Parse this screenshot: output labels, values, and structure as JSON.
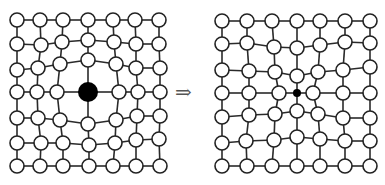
{
  "figure": {
    "arrow_label": "⇒",
    "colors": {
      "atom_fill": "#ffffff",
      "atom_stroke": "#222222",
      "bond": "#2a2a2a",
      "solute": "#000000"
    },
    "atom_radius": 7,
    "left_lattice": {
      "name": "large-solute-lattice",
      "solute": {
        "row": 3,
        "col": 3,
        "x": 88,
        "y": 92,
        "r": 10
      },
      "rows": [
        [
          [
            17,
            20
          ],
          [
            40,
            20
          ],
          [
            63,
            20
          ],
          [
            88,
            20
          ],
          [
            113,
            20
          ],
          [
            135,
            20
          ],
          [
            159,
            20
          ]
        ],
        [
          [
            17,
            44
          ],
          [
            41,
            45
          ],
          [
            62,
            42
          ],
          [
            88,
            40
          ],
          [
            114,
            42
          ],
          [
            136,
            44
          ],
          [
            159,
            44
          ]
        ],
        [
          [
            17,
            70
          ],
          [
            38,
            68
          ],
          [
            60,
            64
          ],
          [
            88,
            60
          ],
          [
            116,
            64
          ],
          [
            136,
            68
          ],
          [
            160,
            68
          ]
        ],
        [
          [
            17,
            92
          ],
          [
            37,
            92
          ],
          [
            57,
            92
          ],
          [
            88,
            92
          ],
          [
            119,
            92
          ],
          [
            138,
            92
          ],
          [
            160,
            92
          ]
        ],
        [
          [
            17,
            118
          ],
          [
            38,
            118
          ],
          [
            60,
            120
          ],
          [
            88,
            124
          ],
          [
            116,
            120
          ],
          [
            137,
            116
          ],
          [
            160,
            116
          ]
        ],
        [
          [
            17,
            143
          ],
          [
            41,
            143
          ],
          [
            63,
            143
          ],
          [
            89,
            145
          ],
          [
            115,
            143
          ],
          [
            136,
            140
          ],
          [
            159,
            139
          ]
        ],
        [
          [
            17,
            166
          ],
          [
            40,
            166
          ],
          [
            63,
            166
          ],
          [
            89,
            166
          ],
          [
            113,
            166
          ],
          [
            136,
            166
          ],
          [
            160,
            166
          ]
        ]
      ]
    },
    "right_lattice": {
      "name": "small-solute-lattice",
      "solute": {
        "row": 3,
        "col": 3,
        "x": 297,
        "y": 93,
        "r": 4
      },
      "rows": [
        [
          [
            222,
            21
          ],
          [
            247,
            21
          ],
          [
            272,
            21
          ],
          [
            297,
            21
          ],
          [
            320,
            21
          ],
          [
            345,
            21
          ],
          [
            370,
            21
          ]
        ],
        [
          [
            222,
            44
          ],
          [
            247,
            43
          ],
          [
            274,
            47
          ],
          [
            297,
            48
          ],
          [
            320,
            45
          ],
          [
            345,
            42
          ],
          [
            370,
            43
          ]
        ],
        [
          [
            222,
            70
          ],
          [
            249,
            71
          ],
          [
            275,
            72
          ],
          [
            297,
            76
          ],
          [
            318,
            72
          ],
          [
            343,
            70
          ],
          [
            370,
            67
          ]
        ],
        [
          [
            222,
            93
          ],
          [
            249,
            93
          ],
          [
            279,
            93
          ],
          [
            297,
            93
          ],
          [
            313,
            93
          ],
          [
            343,
            93
          ],
          [
            370,
            93
          ]
        ],
        [
          [
            222,
            117
          ],
          [
            249,
            115
          ],
          [
            275,
            114
          ],
          [
            297,
            111
          ],
          [
            318,
            114
          ],
          [
            343,
            118
          ],
          [
            370,
            118
          ]
        ],
        [
          [
            222,
            143
          ],
          [
            246,
            141
          ],
          [
            274,
            140
          ],
          [
            297,
            137
          ],
          [
            320,
            139
          ],
          [
            345,
            141
          ],
          [
            370,
            141
          ]
        ],
        [
          [
            222,
            166
          ],
          [
            247,
            166
          ],
          [
            272,
            166
          ],
          [
            297,
            166
          ],
          [
            320,
            166
          ],
          [
            345,
            166
          ],
          [
            370,
            166
          ]
        ]
      ]
    }
  }
}
